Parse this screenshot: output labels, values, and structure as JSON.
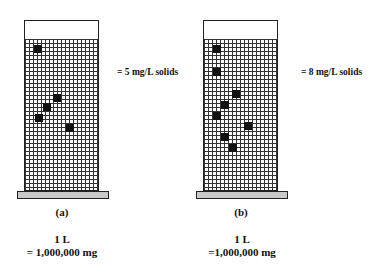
{
  "panels": [
    {
      "id": "a",
      "label": "(a)",
      "concentration_label": "= 5 mg/L solids",
      "volume_label": "1 L",
      "mass_label": "= 1,000,000 mg",
      "particle_count": 5
    },
    {
      "id": "b",
      "label": "(b)",
      "concentration_label": "= 8 mg/L solids",
      "volume_label": "1 L",
      "mass_label": "=1,000,000 mg",
      "particle_count": 8
    }
  ],
  "colors": {
    "grid": "#333333",
    "particle": "#111111",
    "base": "#c8c8c8"
  }
}
